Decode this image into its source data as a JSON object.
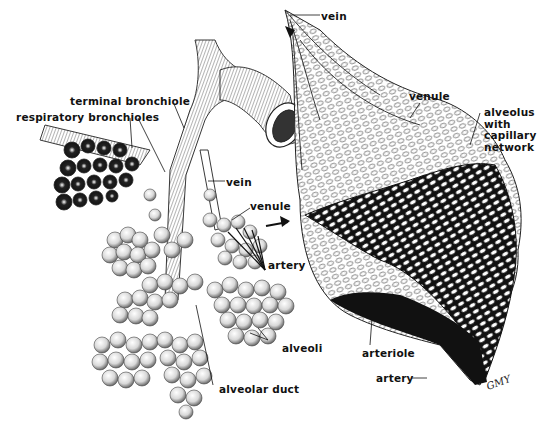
{
  "diagram": {
    "colors": {
      "ink": "#111111",
      "background": "#ffffff",
      "shade": "#8a8a8a"
    },
    "left_panel": {
      "labels": {
        "terminal_bronchiole": "terminal bronchiole",
        "respiratory_bronchioles": "respiratory bronchioles",
        "vein": "vein",
        "venule": "venule",
        "artery": "artery",
        "alveoli": "alveoli",
        "alveolar_duct": "alveolar duct"
      }
    },
    "right_panel": {
      "labels": {
        "vein": "vein",
        "venule": "venule",
        "alveolus_with_capillary_network": "alveolus\nwith\ncapillary\nnetwork",
        "arteriole": "arteriole",
        "artery": "artery"
      }
    },
    "signature": "GMY"
  }
}
